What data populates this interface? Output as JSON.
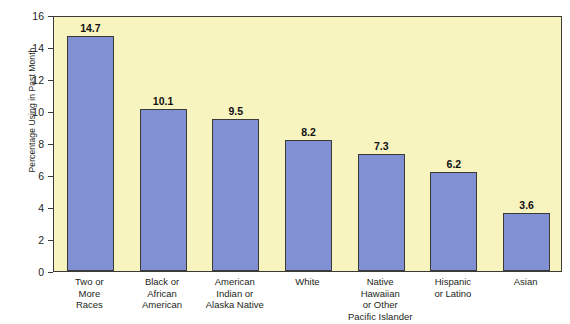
{
  "chart_data": {
    "type": "bar",
    "title": "",
    "subtitle": "",
    "xlabel": "",
    "ylabel": "Percentage Using in Past Month",
    "ylim": [
      0,
      16
    ],
    "ytick_step": 2,
    "yticks": [
      "16",
      "14",
      "12",
      "10",
      "8",
      "6",
      "4",
      "2",
      "0"
    ],
    "grid": false,
    "legend": "none",
    "categories": [
      "Two or\nMore\nRaces",
      "Black or\nAfrican\nAmerican",
      "American\nIndian or\nAlaska Native",
      "White",
      "Native\nHawaiian\nor Other\nPacific Islander",
      "Hispanic\nor Latino",
      "Asian"
    ],
    "values": [
      14.7,
      10.1,
      9.5,
      8.2,
      7.3,
      6.2,
      3.6
    ],
    "value_labels": [
      "14.7",
      "10.1",
      "9.5",
      "8.2",
      "7.3",
      "6.2",
      "3.6"
    ],
    "colors": {
      "bar_fill": "#8190d2",
      "bar_outline": "#3a3a38",
      "plot_background": "#f8f4c0",
      "page_background": "#ffffff",
      "text": "#231f20"
    }
  }
}
